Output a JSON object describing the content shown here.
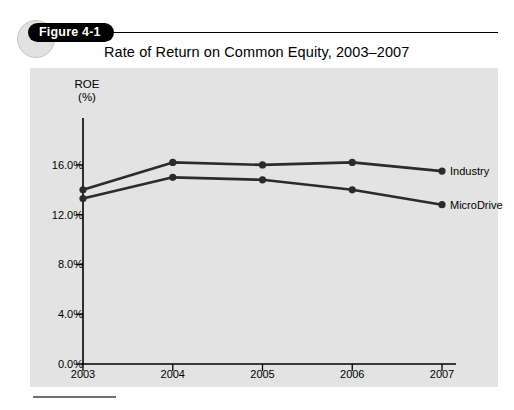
{
  "page": {
    "bleed_text": " "
  },
  "figure": {
    "badge_label": "Figure 4-1",
    "title": "Rate of Return on Common Equity, 2003–2007"
  },
  "chart_data": {
    "type": "line",
    "title": "Rate of Return on Common Equity, 2003–2007",
    "xlabel": "",
    "ylabel": "ROE (%)",
    "ylabel_lines": [
      "ROE",
      "(%)"
    ],
    "categories": [
      "2003",
      "2004",
      "2005",
      "2006",
      "2007"
    ],
    "x": [
      2003,
      2004,
      2005,
      2006,
      2007
    ],
    "series": [
      {
        "name": "Industry",
        "values": [
          14.0,
          16.2,
          16.0,
          16.2,
          15.5
        ],
        "color": "#2b2b2b"
      },
      {
        "name": "MicroDrive",
        "values": [
          13.3,
          15.0,
          14.8,
          14.0,
          12.8
        ],
        "color": "#2b2b2b"
      }
    ],
    "ylim": [
      0.0,
      18.0
    ],
    "yticks": [
      0.0,
      4.0,
      8.0,
      12.0,
      16.0
    ],
    "ytick_labels": [
      "0.0%",
      "4.0%",
      "8.0%",
      "12.0%",
      "16.0%"
    ],
    "xtick_labels": [
      "2003",
      "2004",
      "2005",
      "2006",
      "2007"
    ],
    "grid": false,
    "legend": "inline-right-of-last-point",
    "panel_color": "#e3e3e3",
    "axis_color": "#000000",
    "marker": "filled-circle"
  }
}
